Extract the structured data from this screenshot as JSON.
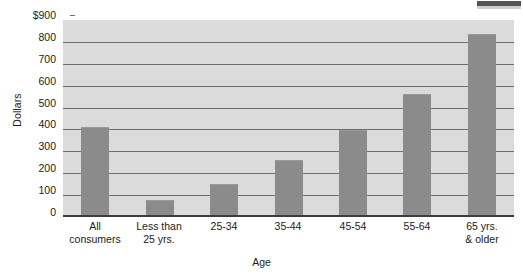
{
  "chart_data": {
    "type": "bar",
    "title": "",
    "subtitle": "",
    "xlabel": "Age",
    "ylabel": "Dollars",
    "categories": [
      "All consumers",
      "Less than 25 yrs.",
      "25-34",
      "35-44",
      "45-54",
      "55-64",
      "65 yrs. & older"
    ],
    "category_lines": [
      [
        "All",
        "consumers"
      ],
      [
        "Less than",
        "25 yrs."
      ],
      [
        "25-34"
      ],
      [
        "35-44"
      ],
      [
        "45-54"
      ],
      [
        "55-64"
      ],
      [
        "65 yrs.",
        "& older"
      ]
    ],
    "values": [
      410,
      78,
      150,
      262,
      398,
      562,
      838
    ],
    "ylim": [
      0,
      900
    ],
    "ytick_step": 100,
    "ytick_labels": [
      "$900",
      "800",
      "700",
      "600",
      "500",
      "400",
      "300",
      "200",
      "100",
      "0"
    ],
    "ytick_values": [
      900,
      800,
      700,
      600,
      500,
      400,
      300,
      200,
      100,
      0
    ],
    "grid": "horizontal",
    "legend": "none",
    "bar_color": "#8b8b8b",
    "plot_background": "#dbdbdb",
    "gridline_color": "#6d6d6d",
    "axis_color": "#3d3d3d",
    "text_color": "#1c1c1c",
    "page_background": "#ffffff"
  },
  "artifact": {
    "name": "scan-edge-artifact",
    "color": "#565656"
  }
}
